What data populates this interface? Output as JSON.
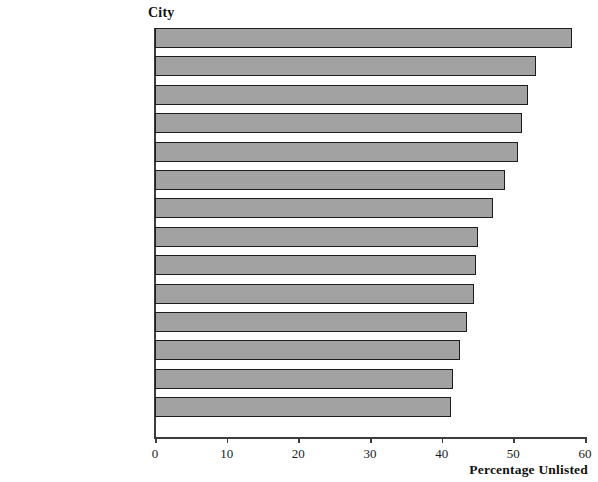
{
  "chart_data": {
    "type": "bar",
    "orientation": "horizontal",
    "title": "",
    "ylabel": "City",
    "xlabel": "Percentage Unlisted",
    "xlim": [
      0,
      60
    ],
    "xticks": [
      0,
      10,
      20,
      30,
      40,
      50,
      60
    ],
    "grid": false,
    "legend": null,
    "bar_color": "#a2a2a2",
    "bar_edge_color": "#1d1d1d",
    "axis_color": "#3c3c3c",
    "categories": [
      "Las Vegas, NV",
      "Los Angeles–Long Beach, CA",
      "Jersey City, NJ",
      "Oakland, CA",
      "Fresno, CA",
      "San Jose, CA",
      "Sacramento, CA",
      "Riverside–San Bernadino, CA",
      "Bakersfield, CA",
      "Oxnard–Ventura, CA",
      "Anaheim–Santa Ana, CA",
      "San Francisco, CA",
      "Tuscon, AZ",
      "San Diego, CA"
    ],
    "values": [
      58.2,
      53.2,
      52.1,
      51.2,
      50.7,
      48.9,
      47.2,
      45.1,
      44.8,
      44.5,
      43.5,
      42.6,
      41.6,
      41.3
    ]
  }
}
